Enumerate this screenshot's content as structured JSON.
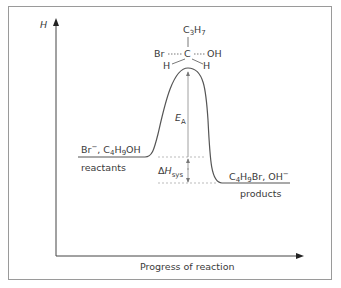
{
  "diagram": {
    "type": "reaction-energy-profile",
    "y_axis_label": "H",
    "x_axis_label": "Progress of reaction",
    "reactants": {
      "species_parts": [
        {
          "t": "Br"
        },
        {
          "t": "−",
          "sup": true
        },
        {
          "t": ", C"
        },
        {
          "t": "4",
          "sub": true
        },
        {
          "t": "H"
        },
        {
          "t": "9",
          "sub": true
        },
        {
          "t": "OH"
        }
      ],
      "species_text": "Br⁻, C₄H₉OH",
      "label": "reactants"
    },
    "products": {
      "species_parts": [
        {
          "t": "C"
        },
        {
          "t": "4",
          "sub": true
        },
        {
          "t": "H"
        },
        {
          "t": "9",
          "sub": true
        },
        {
          "t": "Br, OH"
        },
        {
          "t": "−",
          "sup": true
        }
      ],
      "species_text": "C₄H₉Br, OH⁻",
      "label": "products"
    },
    "transition_state": {
      "top": "C",
      "top_sub": "3",
      "top_h": "H",
      "top_h_sub": "7",
      "center": "C",
      "left": "Br",
      "right": "OH",
      "bottom_left": "H",
      "bottom_right": "H"
    },
    "activation_energy": {
      "main": "E",
      "sub": "A"
    },
    "enthalpy_change": {
      "delta": "Δ",
      "main": "H",
      "sub": "sys"
    },
    "levels": {
      "reactants": 0.42,
      "products": 0.31,
      "transition_state": 0.81
    },
    "colors": {
      "line": "#555555",
      "frame": "#9a9a9a",
      "dashed": "#aaaaaa",
      "text": "#3a3a3a"
    }
  }
}
